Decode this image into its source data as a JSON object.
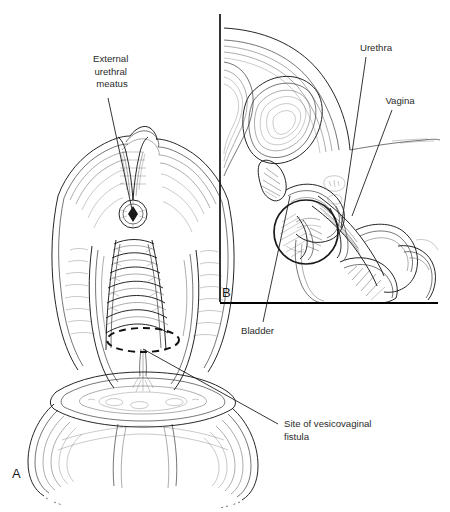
{
  "figure": {
    "title": "Vesicovaginal fistula",
    "background_color": "#ffffff",
    "ink_color": "#1a1a1a",
    "label_color": "#2b2b2b"
  },
  "panels": [
    {
      "letter": "A",
      "name": "anterior-vaginal-view",
      "x": 12,
      "y": 478
    },
    {
      "letter": "B",
      "name": "sagittal-section-view",
      "x": 222,
      "y": 297
    }
  ],
  "annotations": [
    {
      "name": "external-urethral-meatus",
      "lines": [
        "External",
        "urethral",
        "meatus"
      ],
      "align": "middle",
      "text_x": 112,
      "text_y": 62,
      "leader": {
        "x1": 108,
        "y1": 98,
        "x2": 133,
        "y2": 214
      }
    },
    {
      "name": "urethra",
      "lines": [
        "Urethra"
      ],
      "align": "middle",
      "text_x": 376,
      "text_y": 51,
      "leader": {
        "x1": 366,
        "y1": 57,
        "x2": 341,
        "y2": 228
      }
    },
    {
      "name": "vagina",
      "lines": [
        "Vagina"
      ],
      "align": "middle",
      "text_x": 400,
      "text_y": 104,
      "leader": {
        "x1": 392,
        "y1": 110,
        "x2": 352,
        "y2": 216
      }
    },
    {
      "name": "bladder",
      "lines": [
        "Bladder"
      ],
      "align": "start",
      "text_x": 241,
      "text_y": 334,
      "leader": {
        "x1": 263,
        "y1": 322,
        "x2": 290,
        "y2": 196
      }
    },
    {
      "name": "site-of-vesicovaginal-fistula",
      "lines": [
        "Site of vesicovaginal",
        "fistula"
      ],
      "align": "start",
      "text_x": 284,
      "text_y": 427,
      "leader": {
        "x1": 278,
        "y1": 424,
        "x2": 143,
        "y2": 349
      }
    }
  ],
  "markers": {
    "fistula_dashed_ellipse": {
      "name": "fistula-site-dashed-outline",
      "cx": 143,
      "cy": 340,
      "rx": 36,
      "ry": 12
    },
    "fistula_circle_sagittal": {
      "name": "fistula-region-circle",
      "cx": 306,
      "cy": 232,
      "r": 32
    }
  },
  "panel_b_frame": {
    "name": "panel-b-border",
    "vertical": {
      "x": 220,
      "y1": 14,
      "y2": 302
    },
    "horizontal": {
      "y": 303,
      "x1": 220,
      "x2": 438
    }
  }
}
